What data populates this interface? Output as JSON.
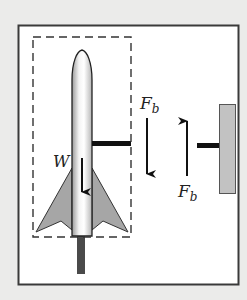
{
  "diagram": {
    "labels": {
      "weight": "W",
      "force_rocket_symbol": "F",
      "force_rocket_subscript": "b",
      "force_wall_symbol": "F",
      "force_wall_subscript": "b"
    },
    "elements": {
      "system_boundary": "dashed box around rocket",
      "rocket": "rocket with nose cone and two fins",
      "launch_rod": "vertical rod below rocket",
      "rocket_lug": "horizontal bar from rocket",
      "wall": "shaded wall at right",
      "wall_lug": "horizontal bar from wall"
    },
    "forces": [
      {
        "name": "W",
        "direction": "down",
        "acts_on": "rocket"
      },
      {
        "name": "F_b",
        "direction": "down",
        "acts_on": "rocket (on lug)"
      },
      {
        "name": "F_b",
        "direction": "up",
        "acts_on": "wall"
      }
    ],
    "colors": {
      "background": "#ebebea",
      "frame_fill": "#ffffff",
      "frame_stroke": "#3a3a3a",
      "fin_fill": "#a6a6a6",
      "wall_fill": "#c2c2c2",
      "rod_fill": "#4a4a4a",
      "line": "#111111"
    }
  }
}
